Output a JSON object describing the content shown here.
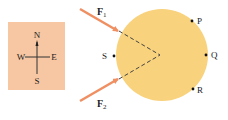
{
  "colors": {
    "compass_bg": "#F6C7A2",
    "disc": "#F8D27C",
    "arrow": "#EF8F62",
    "ink": "#222222"
  },
  "compass": {
    "north": "N",
    "south": "S",
    "east": "E",
    "west": "W"
  },
  "forces": {
    "f1": {
      "symbol": "F",
      "subscript": "1"
    },
    "f2": {
      "symbol": "F",
      "subscript": "2"
    }
  },
  "points": {
    "p": "P",
    "q": "Q",
    "r": "R",
    "s": "S"
  }
}
